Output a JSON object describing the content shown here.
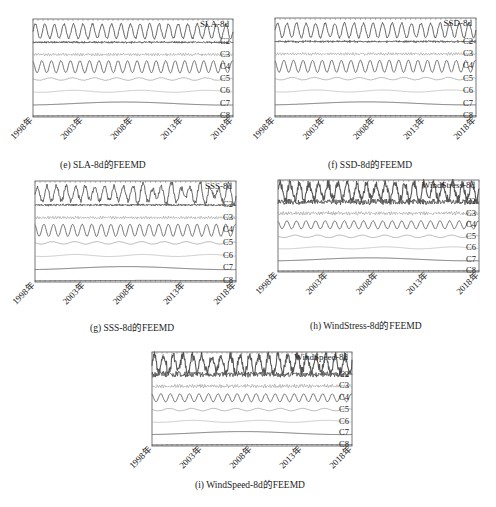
{
  "figures": [
    {
      "id": "e",
      "caption": "(e)  SLA-8d的FEEMD",
      "series_label": "SLA-8d",
      "box": [
        33,
        19,
        200,
        98
      ],
      "caption_pos": [
        60,
        157
      ],
      "style": "sla"
    },
    {
      "id": "f",
      "caption": "(f)  SSD-8d的FEEMD",
      "series_label": "SSD-8d",
      "box": [
        275,
        18,
        201,
        99
      ],
      "caption_pos": [
        328,
        157
      ],
      "style": "ssd"
    },
    {
      "id": "g",
      "caption": "(g)  SSS-8d的FEEMD",
      "series_label": "SSS-8d",
      "box": [
        35,
        181,
        201,
        101
      ],
      "caption_pos": [
        90,
        320
      ],
      "style": "sss"
    },
    {
      "id": "h",
      "caption": "(h)  WindStress-8d的FEEMD",
      "series_label": "WindStress-8d",
      "box": [
        278,
        180,
        201,
        92
      ],
      "caption_pos": [
        310,
        318
      ],
      "style": "wind"
    },
    {
      "id": "i",
      "caption": "(i)  WindSpeed-8d的FEEMD",
      "series_label": "WindSpeed-8d",
      "box": [
        152,
        352,
        200,
        94
      ],
      "caption_pos": [
        195,
        477
      ],
      "style": "wind"
    }
  ],
  "chart_data": [
    {
      "type": "line",
      "title": "(e) SLA-8d的FEEMD",
      "xlabel": "",
      "ylabel": "",
      "x_ticks": [
        "1998年",
        "2003年",
        "2008年",
        "2013年",
        "2018年"
      ],
      "series": [
        {
          "name": "SLA-8d"
        },
        {
          "name": "C2"
        },
        {
          "name": "C3"
        },
        {
          "name": "C4"
        },
        {
          "name": "C5"
        },
        {
          "name": "C6"
        },
        {
          "name": "C7"
        },
        {
          "name": "C8"
        }
      ],
      "grid": false
    },
    {
      "type": "line",
      "title": "(f) SSD-8d的FEEMD",
      "x_ticks": [
        "1998年",
        "2003年",
        "2008年",
        "2013年",
        "2018年"
      ],
      "series": [
        {
          "name": "SSD-8d"
        },
        {
          "name": "C2"
        },
        {
          "name": "C3"
        },
        {
          "name": "C4"
        },
        {
          "name": "C5"
        },
        {
          "name": "C6"
        },
        {
          "name": "C7"
        },
        {
          "name": "C8"
        }
      ],
      "grid": false
    },
    {
      "type": "line",
      "title": "(g) SSS-8d的FEEMD",
      "x_ticks": [
        "1998年",
        "2003年",
        "2008年",
        "2013年",
        "2018年"
      ],
      "series": [
        {
          "name": "SSS-8d"
        },
        {
          "name": "C2"
        },
        {
          "name": "C3"
        },
        {
          "name": "C4"
        },
        {
          "name": "C5"
        },
        {
          "name": "C6"
        },
        {
          "name": "C7"
        },
        {
          "name": "C8"
        }
      ],
      "grid": false
    },
    {
      "type": "line",
      "title": "(h) WindStress-8d的FEEMD",
      "x_ticks": [
        "1998年",
        "2003年",
        "2008年",
        "2013年",
        "2018年"
      ],
      "series": [
        {
          "name": "WindStress-8d"
        },
        {
          "name": "C2"
        },
        {
          "name": "C3"
        },
        {
          "name": "C4"
        },
        {
          "name": "C5"
        },
        {
          "name": "C6"
        },
        {
          "name": "C7"
        },
        {
          "name": "C8"
        }
      ],
      "grid": false
    },
    {
      "type": "line",
      "title": "(i) WindSpeed-8d的FEEMD",
      "x_ticks": [
        "1998年",
        "2003年",
        "2008年",
        "2013年",
        "2018年"
      ],
      "series": [
        {
          "name": "WindSpeed-8d"
        },
        {
          "name": "C2"
        },
        {
          "name": "C3"
        },
        {
          "name": "C4"
        },
        {
          "name": "C5"
        },
        {
          "name": "C6"
        },
        {
          "name": "C7"
        },
        {
          "name": "C8"
        }
      ],
      "grid": false
    }
  ],
  "components": [
    "C2",
    "C3",
    "C4",
    "C5",
    "C6",
    "C7",
    "C8"
  ],
  "x_ticks": [
    "1998年",
    "2003年",
    "2008年",
    "2013年",
    "2018年"
  ]
}
